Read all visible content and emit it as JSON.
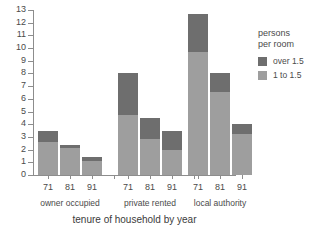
{
  "chart_data": {
    "type": "bar",
    "stacked": true,
    "title": "",
    "xlabel": "tenure of household by year",
    "ylabel": "",
    "ylim": [
      0,
      13
    ],
    "ytick_step": 1,
    "yticks": [
      0,
      1,
      2,
      3,
      4,
      5,
      6,
      7,
      8,
      9,
      10,
      11,
      12,
      13
    ],
    "grid": false,
    "categories": [
      "71",
      "81",
      "91",
      "71",
      "81",
      "91",
      "71",
      "81",
      "91"
    ],
    "groups": [
      {
        "label": "owner occupied",
        "years": [
          "71",
          "81",
          "91"
        ],
        "totals": [
          3.5,
          2.4,
          1.4
        ],
        "light_1_to_1_5": [
          2.6,
          2.1,
          1.1
        ],
        "dark_over_1_5": [
          0.9,
          0.3,
          0.3
        ]
      },
      {
        "label": "private rented",
        "years": [
          "71",
          "81",
          "91"
        ],
        "totals": [
          8.0,
          4.5,
          3.5
        ],
        "light_1_to_1_5": [
          4.7,
          2.8,
          2.0
        ],
        "dark_over_1_5": [
          3.3,
          1.7,
          1.5
        ]
      },
      {
        "label": "local authority",
        "years": [
          "71",
          "81",
          "91"
        ],
        "totals": [
          12.7,
          8.0,
          4.0
        ],
        "light_1_to_1_5": [
          9.7,
          6.5,
          3.2
        ],
        "dark_over_1_5": [
          3.0,
          1.5,
          0.8
        ]
      }
    ],
    "series": [
      {
        "name": "1 to 1.5",
        "color": "#9e9e9e",
        "values": [
          2.6,
          2.1,
          1.1,
          4.7,
          2.8,
          2.0,
          9.7,
          6.5,
          3.2
        ]
      },
      {
        "name": "over 1.5",
        "color": "#6e6e6e",
        "values": [
          0.9,
          0.3,
          0.3,
          3.3,
          1.7,
          1.5,
          3.0,
          1.5,
          0.8
        ]
      }
    ],
    "legend": {
      "position": "right",
      "title_line1": "persons",
      "title_line2": "per room",
      "entries": [
        {
          "label": "over 1.5",
          "color": "#6e6e6e"
        },
        {
          "label": "1 to 1.5",
          "color": "#9e9e9e"
        }
      ]
    }
  },
  "colors": {
    "dark": "#6e6e6e",
    "light": "#9e9e9e",
    "axis": "#8d8d8d",
    "text": "#4a4a4a",
    "background": "#ffffff"
  }
}
